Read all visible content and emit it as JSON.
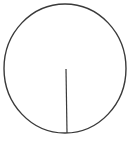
{
  "diagram": {
    "type": "circle-with-radius",
    "stroke_color": "#3a3a3a",
    "background": "#ffffff",
    "circle": {
      "cx": 65,
      "cy": 68.5,
      "rx": 61,
      "ry": 64.5,
      "stroke_width": 1.4
    },
    "radius_line": {
      "x1": 66,
      "y1": 69,
      "x2": 67,
      "y2": 133,
      "stroke_width": 1.2
    }
  }
}
